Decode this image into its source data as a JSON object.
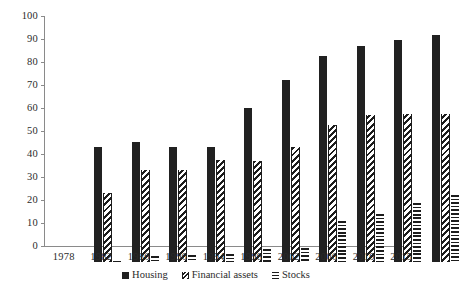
{
  "chart_data": {
    "type": "bar",
    "title": "",
    "subtitle": "",
    "xlabel": "",
    "ylabel": "",
    "ylim": [
      0,
      100
    ],
    "yticks": [
      0,
      10,
      20,
      30,
      40,
      50,
      60,
      70,
      80,
      90,
      100
    ],
    "grid": false,
    "legend_position": "bottom",
    "categories": [
      "1978",
      "1982",
      "1986",
      "1990",
      "1994",
      "1998",
      "2002",
      "2006",
      "2010",
      "2015"
    ],
    "series": [
      {
        "name": "Housing",
        "pattern": "solid",
        "color": "#212121",
        "values": [
          50,
          52,
          50,
          50,
          67,
          79,
          89.5,
          94,
          96.5,
          98.5
        ]
      },
      {
        "name": "Financial assets",
        "pattern": "diagonal-stripe",
        "color": "#1c1c1c",
        "values": [
          30,
          40,
          40,
          44.5,
          44,
          50,
          59.5,
          64,
          64.5,
          64.5
        ]
      },
      {
        "name": "Stocks",
        "pattern": "horizontal-stripe",
        "color": "#1c1c1c",
        "values": [
          0.5,
          2.5,
          3,
          3.5,
          5.5,
          6,
          18,
          21,
          25.5,
          29
        ]
      }
    ]
  },
  "axis": {
    "y_labels": [
      "100",
      "90",
      "80",
      "70",
      "60",
      "50",
      "40",
      "30",
      "20",
      "10",
      "0"
    ],
    "x_labels": [
      "1978",
      "1982",
      "1986",
      "1990",
      "1994",
      "1998",
      "2002",
      "2006",
      "2010",
      "2015"
    ]
  },
  "legend": {
    "items": [
      {
        "label": "Housing",
        "swatch": "housing-swatch-icon"
      },
      {
        "label": "Financial assets",
        "swatch": "financial-assets-swatch-icon"
      },
      {
        "label": "Stocks",
        "swatch": "stocks-swatch-icon"
      }
    ]
  }
}
